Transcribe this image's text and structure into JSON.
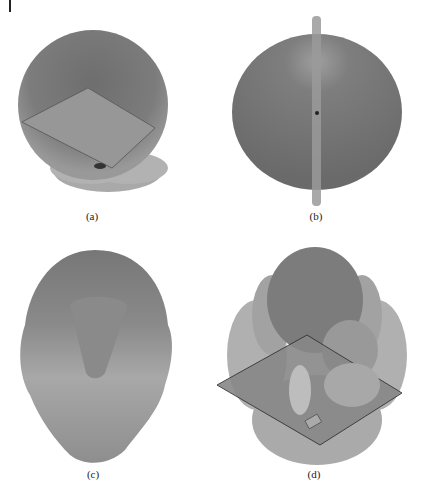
{
  "figure": {
    "panels": [
      {
        "id": "a",
        "caption": "(a)",
        "description": "3D radiation pattern with square ground plane"
      },
      {
        "id": "b",
        "caption": "(b)",
        "description": "3D radiation pattern of dipole (spherical)"
      },
      {
        "id": "c",
        "caption": "(c)",
        "description": "3D radiation pattern, elongated lobe with cone"
      },
      {
        "id": "d",
        "caption": "(d)",
        "description": "3D radiation pattern with ground plane and side lobes"
      }
    ]
  },
  "colors": {
    "dark_lobe": "#7a7a7a",
    "mid_lobe": "#9a9a9a",
    "light_lobe": "#b8b8b8",
    "plane": "#8c8c8c",
    "rod": "#a0a0a0"
  }
}
